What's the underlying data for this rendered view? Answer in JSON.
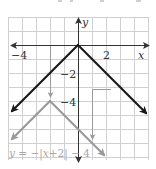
{
  "figure": {
    "x_axis_label": "x",
    "y_axis_label": "y",
    "x_tick_labels": [
      {
        "value": -4,
        "text": "−4"
      },
      {
        "value": 2,
        "text": "2"
      }
    ],
    "y_tick_labels": [
      {
        "value": -2,
        "text": "−2"
      },
      {
        "value": -4,
        "text": "−4"
      }
    ],
    "equation_label": {
      "y": "y",
      "eq": " = −|",
      "x": "x",
      "rest": "+2| − 4"
    },
    "grid": {
      "x_min": -5,
      "x_max": 5,
      "y_min": -8,
      "y_max": 2,
      "step": 1
    },
    "parent_function": {
      "expression": "y = −|x|",
      "vertex": [
        0,
        0
      ],
      "color": "#1a1a1a"
    },
    "transformed_function": {
      "expression": "y = −|x+2| − 4",
      "vertex": [
        -2,
        -4
      ],
      "color": "#9a9a9a"
    },
    "translation_arrows": [
      {
        "from": [
          -2,
          0
        ],
        "to": [
          -2,
          -4
        ],
        "meaning": "shift down 4 (vertex)"
      },
      {
        "from": [
          2.4,
          -3.2
        ],
        "via": [
          1,
          -3.2
        ],
        "to": [
          1,
          -7
        ],
        "meaning": "shift left 2, down 4"
      }
    ],
    "colors": {
      "grid": "#d0d0d0",
      "axis": "#333333",
      "parent": "#1a1a1a",
      "transformed": "#9a9a9a"
    }
  }
}
